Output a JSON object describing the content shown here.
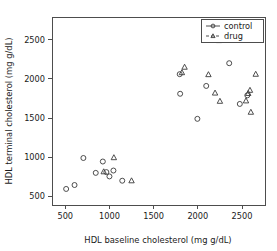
{
  "chart_data": {
    "type": "scatter",
    "title": "",
    "xlabel": "HDL baseline cholesterol (mg g/dL)",
    "ylabel": "HDL terminal cholesterol (mg g/dL)",
    "xlim": [
      350,
      2760
    ],
    "ylim": [
      390,
      2790
    ],
    "xticks": [
      500,
      1000,
      1500,
      2000,
      2500
    ],
    "xticklabels": [
      "500",
      "1000",
      "1500",
      "2000",
      "2500"
    ],
    "yticks": [
      500,
      1000,
      1500,
      2000,
      2500
    ],
    "yticklabels": [
      "500",
      "1000",
      "1500",
      "2000",
      "2500"
    ],
    "grid": false,
    "legend_position": "top-right",
    "series": [
      {
        "name": "control",
        "marker": "circle",
        "linestyle": "solid",
        "color": "#3a3a3a",
        "points": [
          [
            510,
            595
          ],
          [
            605,
            645
          ],
          [
            705,
            990
          ],
          [
            845,
            800
          ],
          [
            925,
            945
          ],
          [
            965,
            810
          ],
          [
            1000,
            755
          ],
          [
            1045,
            830
          ],
          [
            1145,
            700
          ],
          [
            1795,
            2060
          ],
          [
            1800,
            1810
          ],
          [
            1995,
            1490
          ],
          [
            2095,
            1910
          ],
          [
            2355,
            2200
          ],
          [
            2475,
            1680
          ],
          [
            2560,
            1790
          ]
        ]
      },
      {
        "name": "drug",
        "marker": "triangle",
        "linestyle": "dashed",
        "color": "#3a3a3a",
        "points": [
          [
            935,
            815
          ],
          [
            1050,
            995
          ],
          [
            1250,
            700
          ],
          [
            1820,
            2080
          ],
          [
            1850,
            2150
          ],
          [
            2120,
            2055
          ],
          [
            2195,
            1820
          ],
          [
            2240,
            2490
          ],
          [
            2250,
            1715
          ],
          [
            2545,
            1720
          ],
          [
            2570,
            1815
          ],
          [
            2590,
            1855
          ],
          [
            2600,
            1575
          ],
          [
            2655,
            2060
          ]
        ]
      }
    ],
    "legend_entries": [
      {
        "label": "control",
        "marker": "circle",
        "linestyle": "solid"
      },
      {
        "label": "drug",
        "marker": "triangle",
        "linestyle": "dashed"
      }
    ]
  }
}
